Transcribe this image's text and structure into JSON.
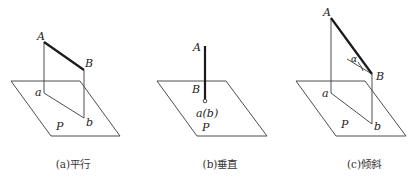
{
  "figure": {
    "panels": [
      {
        "id": "a",
        "caption": "(a)平行",
        "labels": {
          "A": "A",
          "B": "B",
          "a": "a",
          "b": "b",
          "P": "P"
        }
      },
      {
        "id": "b",
        "caption": "(b)垂直",
        "labels": {
          "A": "A",
          "B": "B",
          "ab": "a(b)",
          "P": "P"
        }
      },
      {
        "id": "c",
        "caption": "(c)倾斜",
        "labels": {
          "A": "A",
          "B": "B",
          "a": "a",
          "b": "b",
          "P": "P",
          "alpha": "α"
        }
      }
    ]
  }
}
